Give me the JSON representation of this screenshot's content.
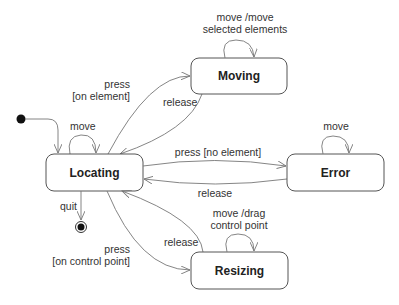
{
  "diagram": {
    "type": "UML state machine",
    "states": [
      {
        "id": "locating",
        "label": "Locating"
      },
      {
        "id": "moving",
        "label": "Moving"
      },
      {
        "id": "error",
        "label": "Error"
      },
      {
        "id": "resizing",
        "label": "Resizing"
      }
    ],
    "pseudo_states": {
      "initial": "initial-state",
      "final": "final-state"
    },
    "transitions": {
      "locating_self": "move",
      "press_on_element_1": "press",
      "press_on_element_2": "[on element]",
      "moving_release": "release",
      "moving_self_1": "move /move",
      "moving_self_2": "selected elements",
      "press_no_element": "press [no element]",
      "error_release": "release",
      "error_self": "move",
      "quit": "quit",
      "press_control_1": "press",
      "press_control_2": "[on control point]",
      "resizing_release": "release",
      "resizing_self_1": "move /drag",
      "resizing_self_2": "control point"
    }
  }
}
